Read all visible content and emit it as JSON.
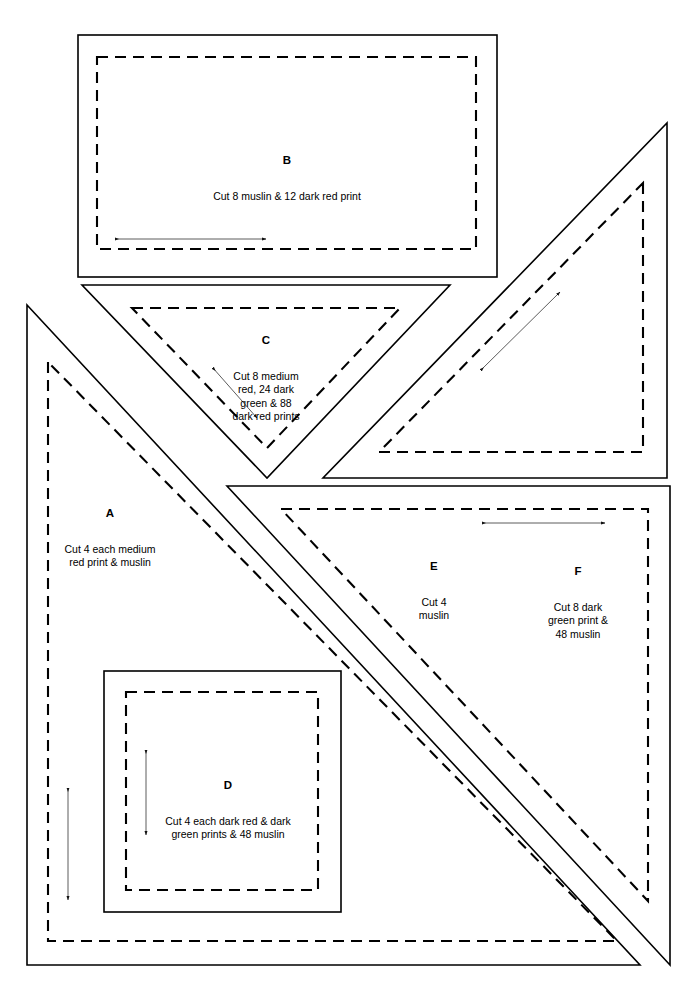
{
  "page": {
    "background_color": "#ffffff",
    "line_color": "#000000",
    "width": 685,
    "height": 982
  },
  "pieces": [
    {
      "id": "A",
      "letter": "A",
      "description": "Cut 4 each medium\nred print & muslin",
      "shape": "right-triangle",
      "label_x": 110,
      "label_y": 492
    },
    {
      "id": "B",
      "letter": "B",
      "description": "Cut 8 muslin & 12 dark red print",
      "shape": "rectangle",
      "label_x": 287,
      "label_y": 140
    },
    {
      "id": "C",
      "letter": "C",
      "description": "Cut 8 medium\nred, 24 dark\ngreen & 88\ndark red prints",
      "shape": "triangle",
      "label_x": 266,
      "label_y": 320
    },
    {
      "id": "D",
      "letter": "D",
      "description": "Cut 4 each dark red & dark\ngreen prints & 48 muslin",
      "shape": "square",
      "label_x": 228,
      "label_y": 765
    },
    {
      "id": "E",
      "letter": "E",
      "description": "Cut 4\nmuslin",
      "shape": "right-triangle",
      "label_x": 434,
      "label_y": 545
    },
    {
      "id": "F",
      "letter": "F",
      "description": "Cut 8 dark\ngreen print &\n48 muslin",
      "shape": "right-triangle",
      "label_x": 578,
      "label_y": 551
    }
  ],
  "lines": {
    "cut_line_label": "cutting line (solid)",
    "seam_line_label": "seam line (dashed)",
    "grain_arrow_label": "grain direction arrow"
  }
}
